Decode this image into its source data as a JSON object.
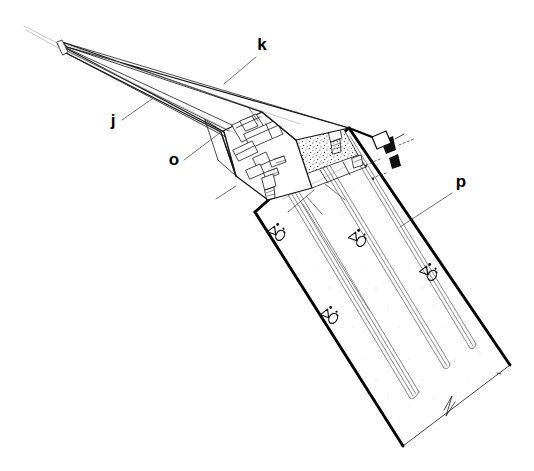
{
  "figure": {
    "background_color": "#ffffff",
    "line_color": "#111111",
    "accent_heavy_color": "#000000",
    "width_px": 534,
    "height_px": 471
  },
  "callouts": [
    {
      "id": "k",
      "label": "k",
      "x": 262,
      "y": 50,
      "leader": [
        [
          256,
          57
        ],
        [
          224,
          84
        ]
      ],
      "target": "upper-tapered-boom"
    },
    {
      "id": "j",
      "label": "j",
      "x": 113,
      "y": 126,
      "leader": [
        [
          122,
          120
        ],
        [
          152,
          99
        ]
      ],
      "target": "lower-spar-rod"
    },
    {
      "id": "o",
      "label": "o",
      "x": 174,
      "y": 165,
      "leader": [
        [
          184,
          160
        ],
        [
          221,
          132
        ]
      ],
      "target": "bracket-fitting"
    },
    {
      "id": "p",
      "label": "p",
      "x": 461,
      "y": 187,
      "leader": [
        [
          452,
          193
        ],
        [
          400,
          227
        ]
      ],
      "target": "skin-panel"
    }
  ],
  "components": {
    "boom": {
      "name": "upper-tapered-boom",
      "tip_x": 38,
      "tip_y": 39
    },
    "spar": {
      "name": "lower-spar-rod",
      "tip_x": 58,
      "tip_y": 44
    },
    "bracket": {
      "name": "bracket-fitting"
    },
    "fasteners": {
      "name": "hex-bolt-group",
      "count": 5
    },
    "panel": {
      "name": "skin-panel",
      "corners": [
        [
          255,
          212
        ],
        [
          349,
          128
        ],
        [
          510,
          365
        ],
        [
          403,
          446
        ]
      ],
      "rib_count": 4,
      "break_line": true
    },
    "stipple_region": {
      "name": "stippled-cut-surface"
    },
    "apex_fitting": {
      "name": "apex-dark-fitting"
    }
  },
  "surface_marks": [
    {
      "name": "surface-mark",
      "x": 276,
      "y": 232,
      "rot": -38
    },
    {
      "name": "surface-mark",
      "x": 357,
      "y": 238,
      "rot": -38
    },
    {
      "name": "surface-mark",
      "x": 428,
      "y": 272,
      "rot": -38
    },
    {
      "name": "surface-mark",
      "x": 329,
      "y": 315,
      "rot": -38
    }
  ]
}
